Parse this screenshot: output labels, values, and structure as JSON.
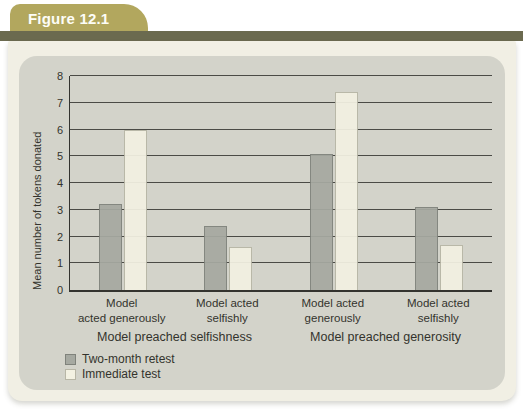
{
  "figure": {
    "label": "Figure 12.1"
  },
  "colors": {
    "tab_bg": "#b2a75e",
    "strip_bg": "#6b6a4f",
    "panel_bg": "#f1efe4",
    "card_bg": "#d3d3ca",
    "grid": "#33332f",
    "text": "#33332d"
  },
  "chart_data": {
    "type": "bar",
    "title": "",
    "ylabel": "Mean number of tokens donated",
    "xlabel": "",
    "ylim": [
      0,
      8
    ],
    "ytick_step": 1,
    "grid": true,
    "legend_position": "bottom-left",
    "categories": [
      "Model acted generously",
      "Model acted selfishly",
      "Model acted generously",
      "Model acted selfishly"
    ],
    "category_lines": [
      [
        "Model",
        "acted generously"
      ],
      [
        "Model acted",
        "selfishly"
      ],
      [
        "Model acted",
        "generously"
      ],
      [
        "Model acted",
        "selfishly"
      ]
    ],
    "group_labels": [
      "Model preached selfishness",
      "Model preached generosity"
    ],
    "series": [
      {
        "name": "Two-month retest",
        "fill": "#a6a9a1",
        "border": "#7f827b",
        "values": [
          3.2,
          2.4,
          5.1,
          3.1
        ]
      },
      {
        "name": "Immediate test",
        "fill": "#f3f1e2",
        "border": "#b8b6a6",
        "values": [
          6.0,
          1.6,
          7.4,
          1.7
        ]
      }
    ]
  }
}
